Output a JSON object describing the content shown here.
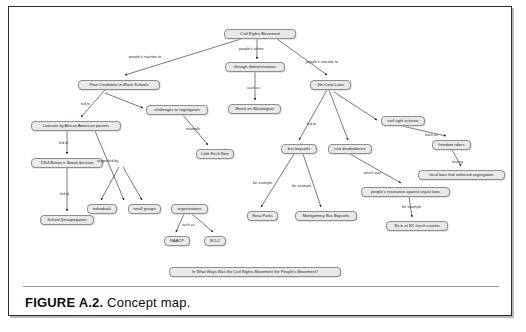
{
  "figure": {
    "label": "FIGURE  A.2.",
    "title": "Concept map."
  },
  "concept_map": {
    "root": "Civil Rights Movement",
    "nodes": [
      {
        "id": "crm",
        "label": "Civil Rights Movement",
        "x": 215,
        "y": 22,
        "w": 72
      },
      {
        "id": "poor",
        "label": "Poor Conditions in Black Schools",
        "x": 69,
        "y": 73,
        "w": 82
      },
      {
        "id": "demos",
        "label": "through demonstrations",
        "x": 216,
        "y": 55,
        "w": 60
      },
      {
        "id": "jim",
        "label": "Jim Crow Laws",
        "x": 301,
        "y": 73,
        "w": 41
      },
      {
        "id": "march",
        "label": "March on Washington",
        "x": 219,
        "y": 97,
        "w": 53
      },
      {
        "id": "challenges",
        "label": "challenges to segregation",
        "x": 137,
        "y": 98,
        "w": 62
      },
      {
        "id": "lawsuits",
        "label": "Lawsuits by African American parents",
        "x": 22,
        "y": 114,
        "w": 90
      },
      {
        "id": "activists",
        "label": "civil right activists",
        "x": 372,
        "y": 109,
        "w": 44
      },
      {
        "id": "brown",
        "label": "1954 Brown v. Board decision",
        "x": 22,
        "y": 151,
        "w": 72
      },
      {
        "id": "little",
        "label": "Little Rock Nine",
        "x": 187,
        "y": 142,
        "w": 38
      },
      {
        "id": "boycotts",
        "label": "bus boycotts",
        "x": 272,
        "y": 137,
        "w": 36
      },
      {
        "id": "disobedience",
        "label": "civil disobedience",
        "x": 319,
        "y": 137,
        "w": 44
      },
      {
        "id": "riders",
        "label": "freedom riders",
        "x": 423,
        "y": 133,
        "w": 39
      },
      {
        "id": "locallaws",
        "label": "local laws that enforced segregation",
        "x": 409,
        "y": 163,
        "w": 87
      },
      {
        "id": "resistance",
        "label": "people's resistance against unjust laws",
        "x": 352,
        "y": 180,
        "w": 89
      },
      {
        "id": "individuals",
        "label": "individuals",
        "x": 78,
        "y": 197,
        "w": 30
      },
      {
        "id": "smallgroups",
        "label": "small groups",
        "x": 119,
        "y": 197,
        "w": 33
      },
      {
        "id": "organizations",
        "label": "organizations",
        "x": 162,
        "y": 197,
        "w": 37
      },
      {
        "id": "desegregation",
        "label": "School Desegregation",
        "x": 31,
        "y": 208,
        "w": 54
      },
      {
        "id": "rosa",
        "label": "Rosa Parks",
        "x": 238,
        "y": 204,
        "w": 31
      },
      {
        "id": "montgomery",
        "label": "Montgomery Bus Boycotts",
        "x": 286,
        "y": 204,
        "w": 62
      },
      {
        "id": "sitin",
        "label": "Sit-in at NC lunch counter",
        "x": 377,
        "y": 214,
        "w": 62
      },
      {
        "id": "naacp",
        "label": "NAACP",
        "x": 155,
        "y": 229,
        "w": 26
      },
      {
        "id": "sclc",
        "label": "SCLC",
        "x": 195,
        "y": 229,
        "w": 22
      },
      {
        "id": "question",
        "label": "In What Ways Was the Civil Rights Movement the People's Movement?",
        "x": 160,
        "y": 260,
        "w": 172
      }
    ],
    "edges": [
      {
        "from": "crm",
        "to": "poor",
        "label": "people's reaction to",
        "lx": 120,
        "ly": 49
      },
      {
        "from": "crm",
        "to": "demos",
        "label": "people's action",
        "lx": 230,
        "ly": 41
      },
      {
        "from": "crm",
        "to": "jim",
        "label": "people's reaction to",
        "lx": 297,
        "ly": 54
      },
      {
        "from": "demos",
        "to": "march",
        "label": "such as",
        "lx": 238,
        "ly": 80
      },
      {
        "from": "poor",
        "to": "lawsuits",
        "label": "led to",
        "lx": 72,
        "ly": 96
      },
      {
        "from": "poor",
        "to": "challenges",
        "label": "",
        "lx": 0,
        "ly": 0
      },
      {
        "from": "challenges",
        "to": "little",
        "label": "example",
        "lx": 177,
        "ly": 121
      },
      {
        "from": "lawsuits",
        "to": "brown",
        "label": "led to",
        "lx": 50,
        "ly": 135
      },
      {
        "from": "lawsuits",
        "to": "organizations",
        "label": "supported by",
        "lx": 88,
        "ly": 153
      },
      {
        "from": "brown",
        "to": "desegregation",
        "label": "led to",
        "lx": 51,
        "ly": 186
      },
      {
        "from": "organizations",
        "to": "individuals",
        "label": "",
        "lx": 0,
        "ly": 0
      },
      {
        "from": "organizations",
        "to": "smallgroups",
        "label": "",
        "lx": 0,
        "ly": 0
      },
      {
        "from": "organizations",
        "to": "naacp",
        "label": "such as",
        "lx": 173,
        "ly": 217
      },
      {
        "from": "organizations",
        "to": "sclc",
        "label": "",
        "lx": 0,
        "ly": 0
      },
      {
        "from": "jim",
        "to": "boycotts",
        "label": "led to",
        "lx": 298,
        "ly": 116
      },
      {
        "from": "jim",
        "to": "disobedience",
        "label": "",
        "lx": 0,
        "ly": 0
      },
      {
        "from": "jim",
        "to": "activists",
        "label": "",
        "lx": 0,
        "ly": 0
      },
      {
        "from": "boycotts",
        "to": "rosa",
        "label": "for example",
        "lx": 244,
        "ly": 175
      },
      {
        "from": "boycotts",
        "to": "montgomery",
        "label": "for example",
        "lx": 283,
        "ly": 178
      },
      {
        "from": "activists",
        "to": "riders",
        "label": "such as",
        "lx": 416,
        "ly": 127
      },
      {
        "from": "riders",
        "to": "locallaws",
        "label": "testing",
        "lx": 443,
        "ly": 154
      },
      {
        "from": "disobedience",
        "to": "resistance",
        "label": "which was",
        "lx": 355,
        "ly": 165
      },
      {
        "from": "resistance",
        "to": "sitin",
        "label": "for example",
        "lx": 393,
        "ly": 199
      }
    ]
  }
}
